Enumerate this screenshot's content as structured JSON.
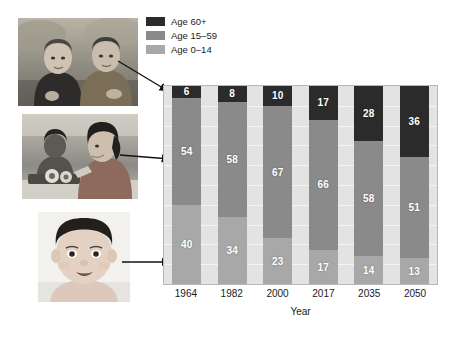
{
  "legend": {
    "items": [
      {
        "label": "Age 60+",
        "color": "#2b2b2b"
      },
      {
        "label": "Age 15–59",
        "color": "#8a8a8a"
      },
      {
        "label": "Age 0–14",
        "color": "#a8a8a8"
      }
    ]
  },
  "photos": [
    {
      "name": "elderly-couple-photo",
      "caption": "Elderly couple sitting outdoors"
    },
    {
      "name": "working-women-photo",
      "caption": "Women working at a factory bench"
    },
    {
      "name": "baby-photo",
      "caption": "Baby portrait"
    }
  ],
  "chart_data": {
    "type": "bar",
    "stacked": true,
    "percent": true,
    "title": "",
    "xlabel": "Year",
    "ylabel": "",
    "ylim": [
      0,
      100
    ],
    "grid": true,
    "legend_position": "top-left",
    "categories": [
      "1964",
      "1982",
      "2000",
      "2017",
      "2035",
      "2050"
    ],
    "series": [
      {
        "name": "Age 60+",
        "color": "#2b2b2b",
        "values": [
          6,
          8,
          10,
          17,
          28,
          36
        ]
      },
      {
        "name": "Age 15–59",
        "color": "#8a8a8a",
        "values": [
          54,
          58,
          67,
          66,
          58,
          51
        ]
      },
      {
        "name": "Age 0–14",
        "color": "#a8a8a8",
        "values": [
          40,
          34,
          23,
          17,
          14,
          13
        ]
      }
    ],
    "plot_background": "#e3e3e3",
    "gridline_values": [
      10,
      20,
      30,
      40,
      50,
      60,
      70,
      80,
      90
    ]
  }
}
